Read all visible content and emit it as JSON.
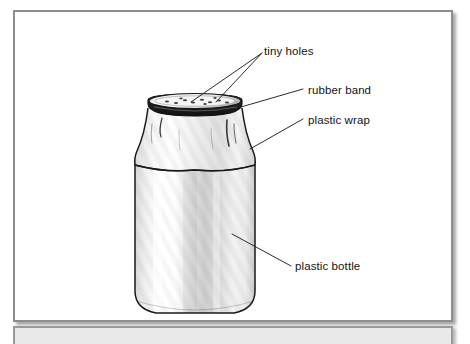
{
  "document": {
    "title": "Plastic bottle terrarium diagram",
    "panel_background": "#ffffff",
    "border_color": "#8d8d8d",
    "bottom_band_color": "#e9e9e9"
  },
  "diagram": {
    "name": "bottle-with-plastic-wrap-cover",
    "labels": [
      {
        "id": "tiny-holes",
        "text": "tiny holes",
        "x": 249,
        "y": 33
      },
      {
        "id": "rubber-band",
        "text": "rubber band",
        "x": 293,
        "y": 72
      },
      {
        "id": "plastic-wrap",
        "text": "plastic wrap",
        "x": 293,
        "y": 102
      },
      {
        "id": "plastic-bottle",
        "text": "plastic bottle",
        "x": 280,
        "y": 248
      }
    ],
    "colors": {
      "outline": "#1a1a1a",
      "rubber_band": "#2e2e2e",
      "bottle_highlight": "#ffffff",
      "bottle_shade": "#c9c9c9",
      "leader_line": "#2b2b2b",
      "hole": "#4a4a4a"
    },
    "hole_count": 11
  }
}
